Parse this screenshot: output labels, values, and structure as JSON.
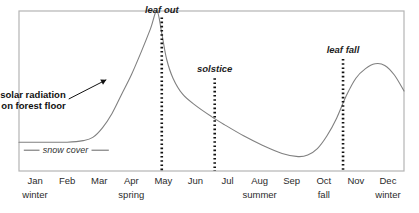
{
  "chart_data": {
    "type": "line",
    "title": "",
    "subtitle": "",
    "xlabel": "",
    "ylabel": "",
    "grid": false,
    "legend_position": "inline-annotations",
    "axis": {
      "frame": true,
      "x_range_months": [
        "Jan",
        "Dec"
      ],
      "y_range": [
        0,
        100
      ],
      "y_ticks_visible": false
    },
    "categories": [
      "Jan",
      "Feb",
      "Mar",
      "Apr",
      "May",
      "Jun",
      "Jul",
      "Aug",
      "Sep",
      "Oct",
      "Nov",
      "Dec"
    ],
    "seasons": [
      {
        "label": "winter",
        "center_month": "Jan"
      },
      {
        "label": "spring",
        "center_month": "Apr"
      },
      {
        "label": "summer",
        "center_month": "Aug"
      },
      {
        "label": "fall",
        "center_month": "Oct"
      },
      {
        "label": "winter",
        "center_month": "Dec"
      }
    ],
    "series": [
      {
        "name": "solar radiation on forest floor",
        "color": "#808080",
        "points": [
          {
            "x": 0.0,
            "y": 18
          },
          {
            "x": 0.5,
            "y": 18
          },
          {
            "x": 1.0,
            "y": 18
          },
          {
            "x": 1.5,
            "y": 18
          },
          {
            "x": 2.0,
            "y": 19
          },
          {
            "x": 2.3,
            "y": 21
          },
          {
            "x": 2.6,
            "y": 27
          },
          {
            "x": 2.9,
            "y": 36
          },
          {
            "x": 3.2,
            "y": 48
          },
          {
            "x": 3.5,
            "y": 60
          },
          {
            "x": 3.8,
            "y": 74
          },
          {
            "x": 4.1,
            "y": 89
          },
          {
            "x": 4.3,
            "y": 100
          },
          {
            "x": 4.45,
            "y": 86
          },
          {
            "x": 4.6,
            "y": 70
          },
          {
            "x": 4.8,
            "y": 58
          },
          {
            "x": 5.1,
            "y": 48
          },
          {
            "x": 5.5,
            "y": 41
          },
          {
            "x": 6.0,
            "y": 34
          },
          {
            "x": 6.4,
            "y": 29
          },
          {
            "x": 7.0,
            "y": 22
          },
          {
            "x": 7.6,
            "y": 16
          },
          {
            "x": 8.2,
            "y": 11
          },
          {
            "x": 8.7,
            "y": 9
          },
          {
            "x": 9.0,
            "y": 10
          },
          {
            "x": 9.3,
            "y": 14
          },
          {
            "x": 9.6,
            "y": 22
          },
          {
            "x": 9.9,
            "y": 33
          },
          {
            "x": 10.2,
            "y": 47
          },
          {
            "x": 10.5,
            "y": 58
          },
          {
            "x": 10.8,
            "y": 64
          },
          {
            "x": 11.1,
            "y": 67
          },
          {
            "x": 11.4,
            "y": 66
          },
          {
            "x": 11.7,
            "y": 60
          },
          {
            "x": 12.0,
            "y": 50
          }
        ]
      }
    ],
    "snow_cover": {
      "label": "snow cover",
      "y": 13,
      "x_start": 0.0,
      "x_end": 2.9,
      "left_tick_x": 0.15,
      "right_tick_x": 2.8
    },
    "event_markers": [
      {
        "label": "leaf out",
        "x": 4.45,
        "label_y": 99,
        "line_top": 96,
        "line_bottom": 0
      },
      {
        "label": "solstice",
        "x": 6.1,
        "label_y": 62,
        "line_top": 58,
        "line_bottom": 0
      },
      {
        "label": "leaf fall",
        "x": 10.1,
        "label_y": 74,
        "line_top": 70,
        "line_bottom": 0
      }
    ],
    "callout": {
      "line1": "solar radiation",
      "line2": "on forest floor",
      "arrow_from": {
        "x": 1.55,
        "y": 45
      },
      "arrow_to": {
        "x": 2.72,
        "y": 57
      }
    },
    "colors": {
      "curve": "#808080",
      "frame": "#b4b4b4",
      "marker": "#111111",
      "text": "#2b2b2b",
      "background": "#ffffff"
    }
  }
}
